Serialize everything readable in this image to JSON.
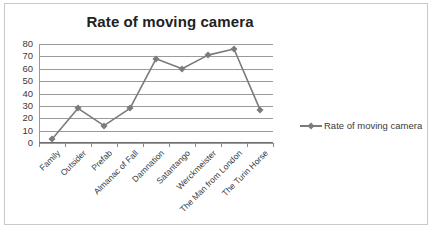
{
  "chart_data": {
    "type": "line",
    "title": "Rate of moving camera",
    "xlabel": "",
    "ylabel": "",
    "ylim": [
      0,
      80
    ],
    "yticks": [
      80,
      70,
      60,
      50,
      40,
      30,
      20,
      10,
      0
    ],
    "grid": true,
    "legend_position": "right",
    "categories": [
      "Family",
      "Outsider",
      "Prefab",
      "Almanac of Fall",
      "Damnation",
      "Satantango",
      "Werckmeister",
      "The Man from London",
      "The Turin Horse"
    ],
    "series": [
      {
        "name": "Rate of moving camera",
        "values": [
          3,
          28,
          14,
          28,
          68,
          60,
          71,
          76,
          27
        ],
        "color": "#7b7b7b",
        "marker": "diamond"
      }
    ]
  },
  "legend": {
    "entries": [
      {
        "label": "Rate of moving camera",
        "color": "#7b7b7b"
      }
    ]
  },
  "colors": {
    "series": "#7b7b7b",
    "gridline": "#9a9a9a",
    "axis": "#6e6e6e",
    "border": "#c9c9c9",
    "text": "#3a3a3a",
    "title": "#222222"
  },
  "caption": ""
}
